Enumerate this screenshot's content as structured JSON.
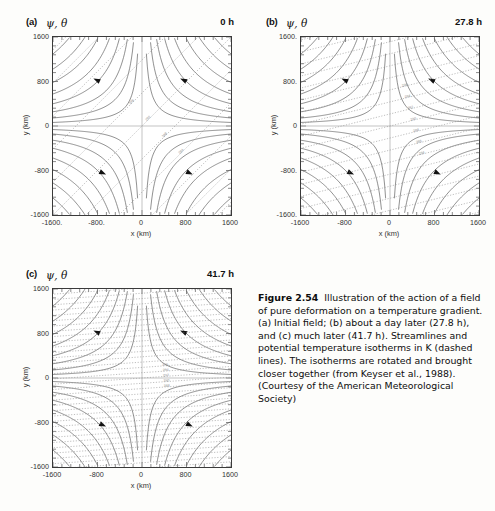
{
  "figure": {
    "number": "Figure 2.54",
    "caption_body": "Illustration of the action of a field of pure deformation on a temperature gradient. (a) Initial field; (b) about a day later (27.8 h), and (c) much later (41.7 h). Streamlines and potential temperature isotherms in K (dashed lines). The isotherms are rotated and brought closer together (from Keyser et al., 1988). (Courtesy of the American Meteorological Society)"
  },
  "axes": {
    "xlabel": "x (km)",
    "ylabel": "y (km)",
    "xticks": [
      "-1600",
      "-800",
      "0",
      "800",
      "1600"
    ],
    "yticks": [
      "1600",
      "800",
      "0",
      "-800",
      "-1600"
    ],
    "xlim": [
      -1600,
      1600
    ],
    "ylim": [
      -1600,
      1600
    ],
    "xtick_values": [
      -1600,
      -800,
      0,
      800,
      1600
    ],
    "ytick_values": [
      1600,
      800,
      0,
      -800,
      -1600
    ]
  },
  "panels": [
    {
      "id": "a",
      "tag": "(a)",
      "symbols": "ψ, θ",
      "time": "0 h",
      "xticklabels": [
        "-1600.",
        "-800.",
        "0",
        "800",
        "1600"
      ],
      "yticklabels": [
        "1600",
        "800",
        "0",
        "-800",
        "-1600"
      ],
      "isotherm_angle_deg": 45,
      "isotherm_spacing_km": 420,
      "isotherm_labels": [
        "284",
        "288",
        "292",
        "296"
      ]
    },
    {
      "id": "b",
      "tag": "(b)",
      "symbols": "ψ, θ",
      "time": "27.8 h",
      "xticklabels": [
        "-1600",
        "-800",
        "0",
        "800",
        "1600"
      ],
      "yticklabels": [
        "1600.",
        "800.",
        "0",
        "-800.",
        "-1600."
      ],
      "isotherm_angle_deg": 14,
      "isotherm_spacing_km": 210,
      "isotherm_labels": [
        "284",
        "286",
        "288",
        "290",
        "292",
        "294",
        "296"
      ]
    },
    {
      "id": "c",
      "tag": "(c)",
      "symbols": "ψ, θ",
      "time": "41.7 h",
      "xticklabels": [
        "-1600",
        "-800",
        "0",
        "800",
        "1600"
      ],
      "yticklabels": [
        "1600",
        "800",
        "0",
        "-800",
        "-1600"
      ],
      "isotherm_angle_deg": 4,
      "isotherm_spacing_km": 95,
      "isotherm_labels": [
        "288",
        "290",
        "292",
        "294",
        "296"
      ]
    }
  ],
  "chart_data": {
    "type": "line",
    "xlabel": "x (km)",
    "ylabel": "y (km)",
    "xlim": [
      -1600,
      1600
    ],
    "ylim": [
      -1600,
      1600
    ],
    "grid": false,
    "legend": "none",
    "streamfunction": "psi = -k * x * y  (hyperbolic streamlines, pure deformation saddle at origin)",
    "streamline_levels": [
      0.04,
      0.09,
      0.16,
      0.25,
      0.36,
      0.49,
      0.64,
      0.81,
      1.0,
      1.21,
      1.44
    ],
    "arrow_quadrant_directions": [
      "upper-left: toward -x",
      "upper-right: toward +y then -x",
      "lower-left: toward -x",
      "lower-right: toward +x"
    ],
    "isotherm_units": "K",
    "isotherm_style": "dashed",
    "panels": [
      {
        "label": "(a)",
        "time_h": 0,
        "isotherm_angle_deg": 45,
        "isotherm_spacing_km": 420,
        "isotherm_values": [
          284,
          288,
          292,
          296
        ]
      },
      {
        "label": "(b)",
        "time_h": 27.8,
        "isotherm_angle_deg": 14,
        "isotherm_spacing_km": 210,
        "isotherm_values": [
          284,
          286,
          288,
          290,
          292,
          294,
          296
        ]
      },
      {
        "label": "(c)",
        "time_h": 41.7,
        "isotherm_angle_deg": 4,
        "isotherm_spacing_km": 95,
        "isotherm_values": [
          288,
          290,
          292,
          294,
          296
        ]
      }
    ]
  }
}
